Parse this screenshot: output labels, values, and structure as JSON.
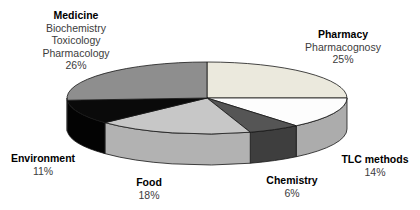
{
  "figure": {
    "background_color": "#ffffff",
    "title": ""
  },
  "chart_data": {
    "type": "pie",
    "style": "3d-exploded-none",
    "title": "",
    "start_angle_deg": 90,
    "direction": "clockwise",
    "legend_position": "labels-around-slices",
    "categories": [
      "Pharmacy",
      "TLC methods",
      "Chemistry",
      "Food",
      "Environment",
      "Medicine"
    ],
    "values": [
      25,
      14,
      6,
      18,
      11,
      26
    ],
    "slices": [
      {
        "label": "Pharmacy",
        "sublabels": [
          "Pharmacognosy"
        ],
        "value": 25,
        "pct_label": "25%",
        "top_color": "#EBE9DD",
        "side_color": "#CBC9BE"
      },
      {
        "label": "TLC methods",
        "sublabels": [],
        "value": 14,
        "pct_label": "14%",
        "top_color": "#FDFDFD",
        "side_color": "#ACACAC"
      },
      {
        "label": "Chemistry",
        "sublabels": [],
        "value": 6,
        "pct_label": "6%",
        "top_color": "#555555",
        "side_color": "#3E3E3E"
      },
      {
        "label": "Food",
        "sublabels": [],
        "value": 18,
        "pct_label": "18%",
        "top_color": "#C7C7C7",
        "side_color": "#B2B2B2"
      },
      {
        "label": "Environment",
        "sublabels": [],
        "value": 11,
        "pct_label": "11%",
        "top_color": "#0A0A0A",
        "side_color": "#030303"
      },
      {
        "label": "Medicine",
        "sublabels": [
          "Biochemistry",
          "Toxicology",
          "Pharmacology"
        ],
        "value": 26,
        "pct_label": "26%",
        "top_color": "#8E8E8E",
        "side_color": "#6F6F6F"
      }
    ],
    "outline_color": "#161616"
  }
}
